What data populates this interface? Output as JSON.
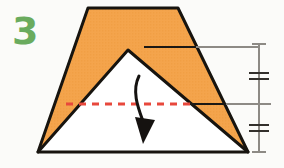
{
  "diagram": {
    "step_number": "3",
    "step_number_color": "#6aab5e",
    "background_color": "#fbfbf9",
    "paper": {
      "front_color": "#f4a44c",
      "back_color": "#ffffff",
      "outline_color": "#17140f",
      "outline_width": 3,
      "shape_name": "notched-trapezoid",
      "description": "Trapezoid of orange paper with a white triangular flap folded up over it",
      "outer_points": "88,8 178,8 248,152 128,50 38,152",
      "inner_triangle_points": "38,152 128,50 248,152",
      "top_edge": {
        "left_x": 88,
        "right_x": 178,
        "y": 8
      },
      "bottom_edge": {
        "left_x": 38,
        "right_x": 248,
        "y": 152
      },
      "apex": {
        "x": 128,
        "y": 50
      }
    },
    "fold_line": {
      "name": "valley-fold-line",
      "style": "dashed",
      "color": "#e8483c",
      "stroke_width": 3,
      "dash_pattern": "7 6",
      "x1": 66,
      "y1": 104,
      "x2": 196,
      "y2": 104,
      "label": "fold here"
    },
    "fold_arrow": {
      "name": "fold-direction-arrow",
      "direction": "down",
      "color": "#151210",
      "stroke_width": 3,
      "path": "M 139 76 C 131 92, 139 110, 144 124",
      "head_points": "136,118 154,120 143,143"
    },
    "dimensions": {
      "line_color": "#8d8a85",
      "leader_color_dark": "#1b1814",
      "vertical_line": {
        "name": "overall-height-dimension-line",
        "x": 259,
        "y_top": 44,
        "y_bottom": 152,
        "cap_half_width": 7
      },
      "leaders": [
        {
          "name": "upper-leader-line",
          "y": 47,
          "dark_x1": 144,
          "dark_x2": 198,
          "gray_x1": 198,
          "gray_x2": 259
        },
        {
          "name": "middle-leader-line",
          "y": 104,
          "dark_x1": 186,
          "dark_x2": 228,
          "gray_x1": 228,
          "gray_x2": 271
        }
      ],
      "tick_marks": [
        {
          "name": "equal-measure-tick-upper",
          "y": 76,
          "count": 2,
          "gap": 5,
          "half_width": 10
        },
        {
          "name": "equal-measure-tick-lower",
          "y": 128,
          "count": 2,
          "gap": 5,
          "half_width": 10
        }
      ],
      "note": "Double hash marks mark two segments of equal length"
    }
  }
}
